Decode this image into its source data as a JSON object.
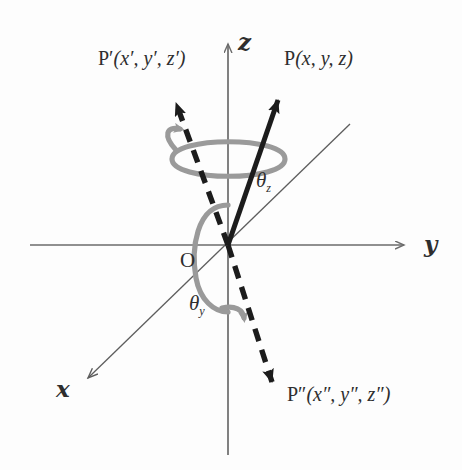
{
  "figure": {
    "background_color": "#fdfdfd",
    "ink_color": "#2e2e2e",
    "axis_color": "#6b6b6b",
    "arc_color": "#9a9a9a",
    "vector_color": "#1c1c1c"
  },
  "axes": [
    {
      "key": "z",
      "label": "z",
      "direction": "up",
      "label_x": 238,
      "label_y": 32
    },
    {
      "key": "y",
      "label": "y",
      "direction": "right",
      "label_x": 424,
      "label_y": 236
    },
    {
      "key": "x",
      "label": "x",
      "direction": "down-left",
      "label_x": 56,
      "label_y": 384
    }
  ],
  "origin": {
    "label": "O",
    "x": 228,
    "y": 245,
    "label_x": 180,
    "label_y": 252
  },
  "points": [
    {
      "key": "P",
      "label": "P",
      "coords": "(x, y, z)",
      "style": "solid",
      "label_x": 284,
      "label_y": 48,
      "tip_x": 281,
      "tip_y": 93
    },
    {
      "key": "P_prime",
      "label": "P′",
      "coords": "(x′, y′, z′)",
      "style": "dashed",
      "label_x": 98,
      "label_y": 48,
      "tip_x": 172,
      "tip_y": 94
    },
    {
      "key": "P_double_prime",
      "label": "P″",
      "coords": "(x″, y″, z″)",
      "style": "dashed",
      "label_x": 287,
      "label_y": 390,
      "tip_x": 277,
      "tip_y": 392
    }
  ],
  "angles": [
    {
      "key": "theta_z",
      "symbol": "θ",
      "subscript": "z",
      "label_x": 256,
      "label_y": 170
    },
    {
      "key": "theta_y",
      "symbol": "θ",
      "subscript": "y",
      "label_x": 189,
      "label_y": 293
    }
  ],
  "rotation_arcs": [
    {
      "key": "arc-about-z",
      "axis": "z",
      "direction": "counterclockwise",
      "arrow": "upper-left"
    },
    {
      "key": "arc-about-y",
      "axis": "y",
      "direction": "clockwise",
      "arrow": "lower-right"
    }
  ]
}
